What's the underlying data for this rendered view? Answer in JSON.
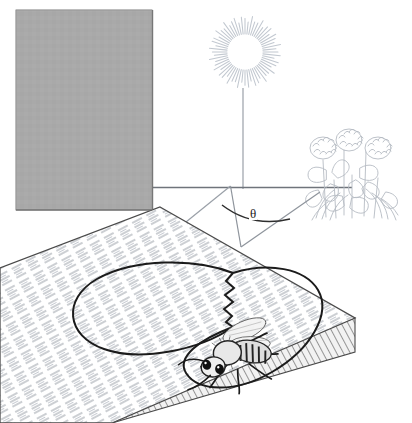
{
  "figure": {
    "caption": "",
    "background_color": "#ffffff",
    "line_color": "#3a3a3a",
    "faint_line_color": "#b9bec6",
    "wall_color": "#a9a9a9",
    "comb_color": "#fdfdfd",
    "comb_edge_color": "#8a8a8a"
  },
  "elements": {
    "sun": {
      "name": "sun",
      "label": "",
      "center_x": 245,
      "center_y": 52,
      "inner_radius": 18,
      "outer_radius": 33,
      "ray_count": 60,
      "color": "#c5cad2"
    },
    "vertical_sun_line": {
      "name": "sun-vertical-line",
      "x": 243,
      "y_top": 88,
      "y_bottom": 188,
      "color": "#9aa0a8"
    },
    "horizon": {
      "name": "horizon-line",
      "y": 187,
      "x_start": 152,
      "x_end": 352,
      "color": "#6f747b"
    },
    "flowers": {
      "name": "clover-flowers",
      "label": "",
      "x": 318,
      "y": 118,
      "width": 92,
      "height": 100,
      "blossom_count": 3,
      "color": "#b8bec6"
    },
    "angle": {
      "name": "angle-theta",
      "symbol": "θ",
      "vertex_x": 241,
      "vertex_y": 247,
      "arc_label_x": 255,
      "arc_label_y": 215,
      "value": ""
    },
    "ray_to_sun": {
      "name": "ray-to-sun",
      "from_x": 241,
      "from_y": 247,
      "to_x": 231,
      "to_y": 188
    },
    "ray_to_flowers": {
      "name": "ray-to-flowers",
      "from_x": 241,
      "from_y": 247,
      "to_x": 318,
      "to_y": 193
    },
    "wall": {
      "name": "background-wall",
      "x": 16,
      "y": 10,
      "width": 136,
      "height": 200,
      "color": "#a9a9a9"
    },
    "comb": {
      "name": "honeycomb-slab",
      "label": "",
      "top_face_points": "160,208 355,318 355,352 112,423 0,423 0,268",
      "surface_hatch": true,
      "hatch_angle_deg": -28
    },
    "dance_path": {
      "name": "waggle-dance-figure-eight",
      "label": "",
      "loop_left_cx": 150,
      "loop_left_cy": 318,
      "loop_right_cx": 243,
      "loop_right_cy": 330,
      "waggle_zigzag_count": 7
    },
    "bee": {
      "name": "honeybee",
      "label": "",
      "x": 196,
      "y": 333,
      "width": 84,
      "height": 70,
      "wing_count": 4,
      "leg_count": 6,
      "antenna_count": 2
    }
  }
}
